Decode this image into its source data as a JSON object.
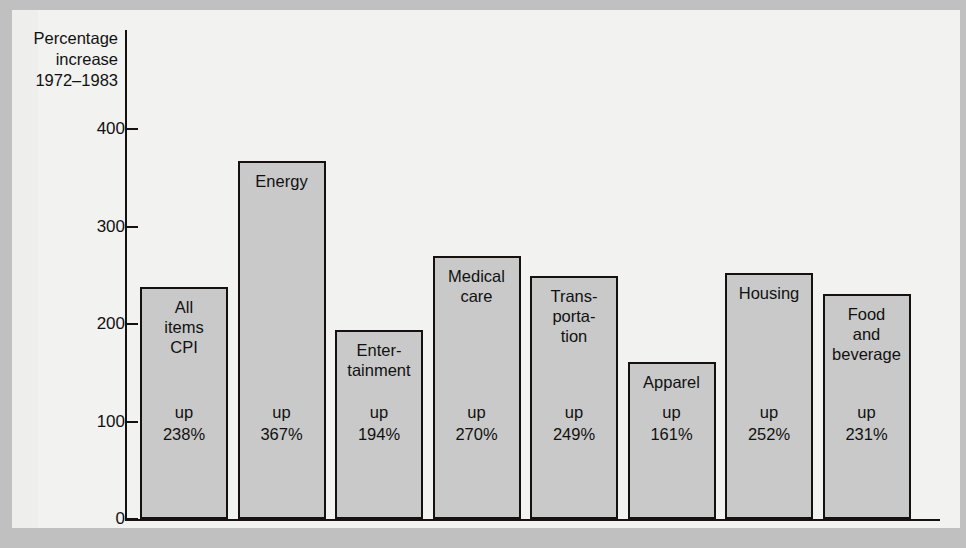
{
  "axis_title": "Percentage\nincrease\n1972–1983",
  "y_ticks": [
    "0",
    "100",
    "200",
    "300",
    "400"
  ],
  "colors": {
    "bar_fill": "#c9c9c9",
    "bar_stroke": "#14110f",
    "panel": "#f2f2f1",
    "surround": "#c0c0c0",
    "text": "#111111"
  },
  "chart_data": {
    "type": "bar",
    "title": "",
    "subtitle": "",
    "xlabel": "",
    "ylabel": "Percentage increase 1972–1983",
    "ylim": [
      0,
      430
    ],
    "yticks": [
      0,
      100,
      200,
      300,
      400
    ],
    "grid": false,
    "legend": "none",
    "categories": [
      "All items CPI",
      "Energy",
      "Entertainment",
      "Medical care",
      "Transportation",
      "Apparel",
      "Housing",
      "Food and beverage"
    ],
    "values": [
      238,
      367,
      194,
      270,
      249,
      161,
      252,
      231
    ],
    "bars": [
      {
        "label": "All\nitems\nCPI",
        "value": 238,
        "value_text": "up\n238%"
      },
      {
        "label": "Energy",
        "value": 367,
        "value_text": "up\n367%"
      },
      {
        "label": "Enter-\ntainment",
        "value": 194,
        "value_text": "up\n194%"
      },
      {
        "label": "Medical\ncare",
        "value": 270,
        "value_text": "up\n270%"
      },
      {
        "label": "Trans-\nporta-\ntion",
        "value": 249,
        "value_text": "up\n249%"
      },
      {
        "label": "Apparel",
        "value": 161,
        "value_text": "up\n161%"
      },
      {
        "label": "Housing",
        "value": 252,
        "value_text": "up\n252%"
      },
      {
        "label": "Food\nand\nbeverage",
        "value": 231,
        "value_text": "up\n231%"
      }
    ]
  }
}
